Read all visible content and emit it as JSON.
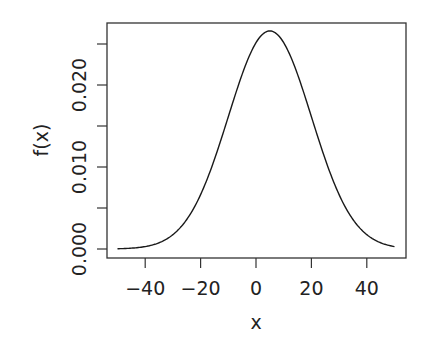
{
  "chart_data": {
    "type": "line",
    "title": "",
    "xlabel": "x",
    "ylabel": "f(x)",
    "xlim": [
      -50,
      50
    ],
    "ylim": [
      0,
      0.0266
    ],
    "grid": false,
    "legend": null,
    "distribution": {
      "family": "normal",
      "mean": 5,
      "sd": 15
    },
    "x_ticks": [
      -40,
      -20,
      0,
      20,
      40
    ],
    "x_tick_labels": [
      "−40",
      "−20",
      "0",
      "20",
      "40"
    ],
    "y_ticks": [
      0.0,
      0.005,
      0.01,
      0.015,
      0.02,
      0.025
    ],
    "y_tick_labels": [
      "0.000",
      "",
      "0.010",
      "",
      "0.020",
      ""
    ],
    "series": [
      {
        "name": "f(x)",
        "x": [
          -50,
          -45,
          -40,
          -35,
          -30,
          -25,
          -20,
          -15,
          -10,
          -5,
          0,
          5,
          10,
          15,
          20,
          25,
          30,
          35,
          40,
          45,
          50
        ],
        "values": [
          3e-05,
          0.0001,
          0.0003,
          0.00076,
          0.00174,
          0.0036,
          0.00665,
          0.01096,
          0.01613,
          0.0213,
          0.02516,
          0.0266,
          0.02516,
          0.0213,
          0.01613,
          0.01096,
          0.00665,
          0.0036,
          0.00174,
          0.00076,
          0.0003
        ]
      }
    ]
  },
  "colors": {
    "line": "#1a1a1a",
    "axis": "#333333",
    "background": "#ffffff"
  }
}
